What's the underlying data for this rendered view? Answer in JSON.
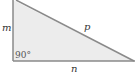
{
  "diagram": {
    "type": "right-triangle",
    "colors": {
      "fill": "#ececec",
      "stroke": "#8a8a8a",
      "text": "#333333"
    },
    "labels": {
      "vertical_side": "m",
      "hypotenuse": "p",
      "base": "n",
      "right_angle": "90°"
    }
  }
}
